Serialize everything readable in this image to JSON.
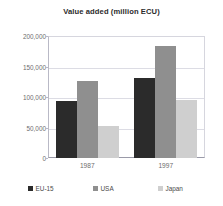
{
  "chart_data": {
    "type": "bar",
    "title": "Value added (million ECU)",
    "xlabel": "",
    "ylabel": "",
    "categories": [
      "1987",
      "1997"
    ],
    "series": [
      {
        "name": "EU-15",
        "color": "#2b2b2b",
        "values": [
          93000,
          131000
        ]
      },
      {
        "name": "USA",
        "color": "#8f8f8f",
        "values": [
          127000,
          183000
        ]
      },
      {
        "name": "Japan",
        "color": "#cfcfcf",
        "values": [
          52000,
          95000
        ]
      }
    ],
    "ylim": [
      0,
      200000
    ],
    "yticks": [
      0,
      50000,
      100000,
      150000,
      200000
    ],
    "ytick_labels": [
      "0",
      "50,000",
      "100,000",
      "150,000",
      "200,000"
    ],
    "grid": true,
    "legend_position": "bottom"
  },
  "legend": {
    "items": [
      {
        "label": "EU-15",
        "color": "#2b2b2b"
      },
      {
        "label": "USA",
        "color": "#8f8f8f"
      },
      {
        "label": "Japan",
        "color": "#cfcfcf"
      }
    ]
  }
}
